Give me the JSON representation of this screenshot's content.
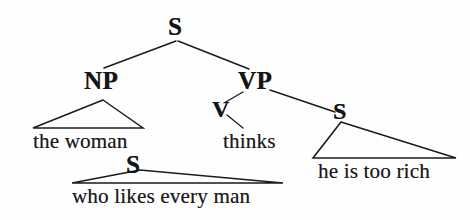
{
  "diagram": {
    "sentence": "the woman who likes every man thinks he is too rich",
    "ink_color": "#151515",
    "background_color": "#ffffff",
    "nodes": {
      "root": "S",
      "np": "NP",
      "vp": "VP",
      "v": "V",
      "embedded_s": "S",
      "relative_s": "S"
    },
    "terminals": {
      "subject": "the woman",
      "verb": "thinks",
      "complement": "he is too rich",
      "relative_clause": "who likes every man"
    }
  }
}
